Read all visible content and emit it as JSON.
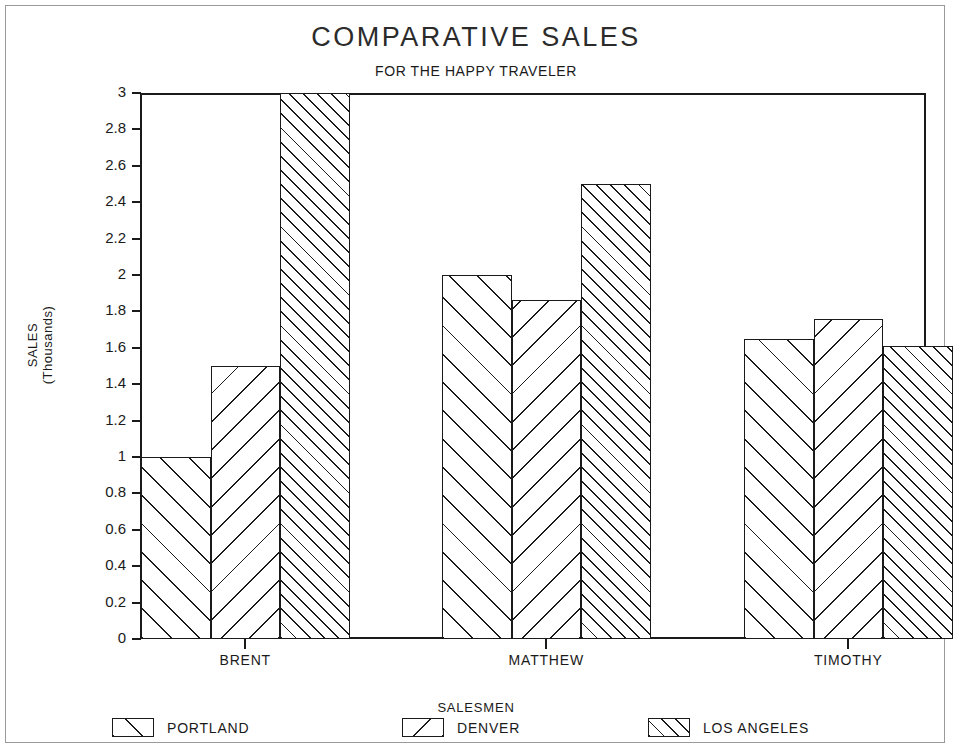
{
  "chart_data": {
    "type": "bar",
    "title": "COMPARATIVE SALES",
    "subtitle": "FOR THE HAPPY TRAVELER",
    "xlabel": "SALESMEN",
    "ylabel": "SALES\n(Thousands)",
    "ylabel_line1": "SALES",
    "ylabel_line2": "(Thousands)",
    "categories": [
      "BRENT",
      "MATTHEW",
      "TIMOTHY"
    ],
    "series": [
      {
        "name": "PORTLAND",
        "pattern": "forward-hatch-sparse",
        "values": [
          1.0,
          2.0,
          1.65
        ]
      },
      {
        "name": "DENVER",
        "pattern": "backward-hatch-sparse",
        "values": [
          1.5,
          1.86,
          1.76
        ]
      },
      {
        "name": "LOS ANGELES",
        "pattern": "forward-hatch-dense",
        "values": [
          3.0,
          2.5,
          1.61
        ]
      }
    ],
    "ylim": [
      0,
      3
    ],
    "ytick_step": 0.2,
    "ytick_labels": [
      "3",
      "2.8",
      "2.6",
      "2.4",
      "2.2",
      "2",
      "1.8",
      "1.6",
      "1.4",
      "1.2",
      "1",
      "0.8",
      "0.6",
      "0.4",
      "0.2",
      "0"
    ],
    "ytick_values": [
      3,
      2.8,
      2.6,
      2.4,
      2.2,
      2,
      1.8,
      1.6,
      1.4,
      1.2,
      1,
      0.8,
      0.6,
      0.4,
      0.2,
      0
    ],
    "grid": false,
    "legend_position": "bottom",
    "colors": {
      "ink": "#1a1a1a",
      "background": "#ffffff",
      "frame": "#9a9a9a"
    }
  }
}
